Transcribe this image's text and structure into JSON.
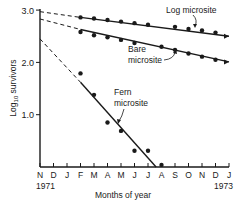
{
  "chart_data": {
    "type": "line",
    "title": "",
    "xlabel": "Months of year",
    "ylabel": "Log10 survivors",
    "ylabel_main": "Log",
    "ylabel_sub": "10",
    "ylabel_rest": " survivors",
    "ylim": [
      0,
      3.0
    ],
    "yticks": [
      {
        "value": 1.0,
        "label": "1.0"
      },
      {
        "value": 2.0,
        "label": "2.0"
      },
      {
        "value": 3.0,
        "label": "3.0"
      }
    ],
    "xticks": [
      "N",
      "D",
      "J",
      "F",
      "M",
      "A",
      "M",
      "J",
      "J",
      "A",
      "S",
      "O",
      "N",
      "D",
      "J"
    ],
    "x_year_start": "1971",
    "x_year_end": "1973",
    "grid": false,
    "series": [
      {
        "name": "Log microsite",
        "label_line1": "Log microsite",
        "points": [
          {
            "x": 3,
            "y": 2.86
          },
          {
            "x": 4,
            "y": 2.84
          },
          {
            "x": 5,
            "y": 2.81
          },
          {
            "x": 6,
            "y": 2.78
          },
          {
            "x": 7,
            "y": 2.75
          },
          {
            "x": 8,
            "y": 2.72
          },
          {
            "x": 10,
            "y": 2.68
          },
          {
            "x": 11,
            "y": 2.64
          },
          {
            "x": 12,
            "y": 2.61
          },
          {
            "x": 13,
            "y": 2.57
          }
        ],
        "fit": {
          "dashed_from": [
            0,
            2.97
          ],
          "solid_from": [
            3,
            2.86
          ],
          "solid_to": [
            14,
            2.5
          ]
        }
      },
      {
        "name": "Bare microsite",
        "label_line1": "Bare",
        "label_line2": "microsite",
        "points": [
          {
            "x": 3,
            "y": 2.58
          },
          {
            "x": 4,
            "y": 2.52
          },
          {
            "x": 5,
            "y": 2.48
          },
          {
            "x": 6,
            "y": 2.43
          },
          {
            "x": 7,
            "y": 2.37
          },
          {
            "x": 9,
            "y": 2.3
          },
          {
            "x": 10,
            "y": 2.24
          },
          {
            "x": 11,
            "y": 2.17
          },
          {
            "x": 12,
            "y": 2.11
          },
          {
            "x": 13,
            "y": 2.05
          }
        ],
        "fit": {
          "dashed_from": [
            0,
            2.83
          ],
          "solid_from": [
            3,
            2.63
          ],
          "solid_to": [
            14,
            2.01
          ]
        }
      },
      {
        "name": "Fern microsite",
        "label_line1": "Fern",
        "label_line2": "microsite",
        "points": [
          {
            "x": 3,
            "y": 1.79
          },
          {
            "x": 4,
            "y": 1.38
          },
          {
            "x": 5,
            "y": 0.85
          },
          {
            "x": 6,
            "y": 0.69
          },
          {
            "x": 7,
            "y": 0.31
          },
          {
            "x": 8,
            "y": 0.31
          },
          {
            "x": 9,
            "y": 0.04
          }
        ],
        "fit": {
          "dashed_from": [
            0,
            2.45
          ],
          "solid_from": [
            3,
            1.62
          ],
          "solid_to": [
            8.6,
            0.0
          ]
        }
      }
    ]
  }
}
